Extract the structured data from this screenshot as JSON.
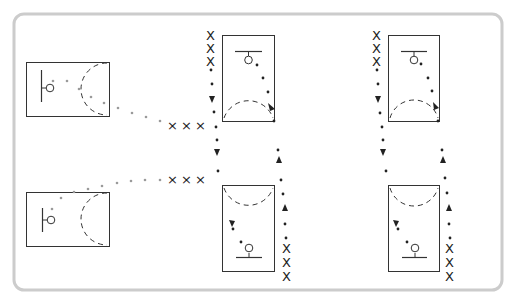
{
  "diagram": {
    "type": "basketball-drill",
    "frame": {
      "stroke": "#cccccc",
      "background": "#ffffff"
    },
    "colors": {
      "court_line": "#333333",
      "pass_dots": "#999999",
      "dribble_dots": "#222222",
      "player": "#222222"
    },
    "player_symbol": "X",
    "stations": [
      {
        "id": "left-top",
        "court": "half-court-horizontal",
        "hoop_side": "left",
        "player_group": "X X X",
        "path": "pass-dotted-gray"
      },
      {
        "id": "left-bottom",
        "court": "half-court-horizontal",
        "hoop_side": "left",
        "player_group": "X X X",
        "path": "pass-dotted-gray"
      },
      {
        "id": "middle-top",
        "court": "half-court-vertical",
        "hoop_side": "top",
        "player_group": "X X X"
      },
      {
        "id": "middle-bottom",
        "court": "half-court-vertical",
        "hoop_side": "bottom",
        "player_group": "X X X"
      },
      {
        "id": "right-top",
        "court": "half-court-vertical",
        "hoop_side": "top",
        "player_group": "X X X"
      },
      {
        "id": "right-bottom",
        "court": "half-court-vertical",
        "hoop_side": "bottom",
        "player_group": "X X X"
      }
    ],
    "labels": {
      "x": "X",
      "x_small": "×"
    }
  }
}
